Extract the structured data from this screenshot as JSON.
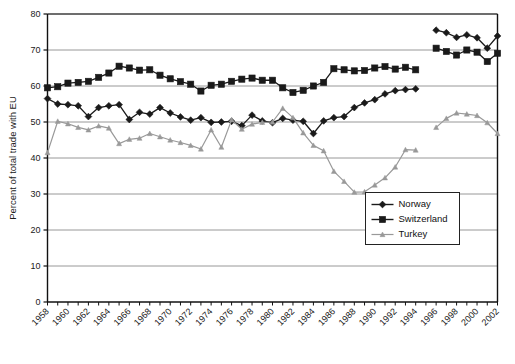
{
  "chart_data": {
    "type": "line",
    "title": "",
    "xlabel": "",
    "ylabel": "Percent of total trade with EU",
    "ylim": [
      0,
      80
    ],
    "ytick_values": [
      0,
      10,
      20,
      30,
      40,
      50,
      60,
      70,
      80
    ],
    "ytick_labels": [
      "0",
      "10",
      "20",
      "30",
      "40",
      "50",
      "60",
      "70",
      "80"
    ],
    "grid": true,
    "grid_axis": "y",
    "legend_position": "center-right",
    "xlim": [
      1958,
      2002
    ],
    "x": [
      1958,
      1959,
      1960,
      1961,
      1962,
      1963,
      1964,
      1965,
      1966,
      1967,
      1968,
      1969,
      1970,
      1971,
      1972,
      1973,
      1974,
      1975,
      1976,
      1977,
      1978,
      1979,
      1980,
      1981,
      1982,
      1983,
      1984,
      1985,
      1986,
      1987,
      1988,
      1989,
      1990,
      1991,
      1992,
      1993,
      1994,
      1995,
      1996,
      1997,
      1998,
      1999,
      2000,
      2001,
      2002
    ],
    "xtick_labels": [
      "1958",
      "1960",
      "1962",
      "1964",
      "1966",
      "1968",
      "1970",
      "1972",
      "1974",
      "1976",
      "1978",
      "1980",
      "1982",
      "1984",
      "1986",
      "1988",
      "1990",
      "1992",
      "1994",
      "1996",
      "1998",
      "2000",
      "2002"
    ],
    "xtick_values": [
      1958,
      1960,
      1962,
      1964,
      1966,
      1968,
      1970,
      1972,
      1974,
      1976,
      1978,
      1980,
      1982,
      1984,
      1986,
      1988,
      1990,
      1992,
      1994,
      1996,
      1998,
      2000,
      2002
    ],
    "series": [
      {
        "name": "Norway",
        "color": "#1a1a1a",
        "marker": "diamond",
        "values": [
          56.5,
          55.0,
          54.8,
          54.5,
          51.5,
          54.0,
          54.5,
          54.8,
          50.7,
          52.7,
          52.2,
          54.0,
          52.5,
          51.4,
          50.5,
          51.2,
          49.9,
          50.0,
          50.2,
          49.0,
          51.9,
          50.3,
          49.8,
          51.0,
          50.5,
          50.2,
          46.8,
          50.3,
          51.2,
          51.5,
          54.0,
          55.3,
          56.2,
          57.8,
          58.7,
          59.0,
          59.2,
          null,
          75.5,
          74.8,
          73.5,
          74.2,
          73.4,
          70.5,
          73.9
        ]
      },
      {
        "name": "Switzerland",
        "color": "#1a1a1a",
        "marker": "square",
        "values": [
          59.5,
          59.8,
          60.8,
          61.0,
          61.3,
          62.4,
          63.6,
          65.5,
          65.0,
          64.4,
          64.5,
          63.0,
          62.0,
          61.2,
          60.5,
          58.6,
          60.2,
          60.5,
          61.3,
          61.9,
          62.2,
          61.6,
          61.6,
          59.5,
          58.2,
          58.8,
          60.0,
          61.0,
          64.8,
          64.5,
          64.2,
          64.3,
          65.0,
          65.4,
          64.7,
          65.2,
          64.5,
          null,
          70.5,
          69.6,
          68.6,
          70.0,
          69.4,
          66.8,
          69.1
        ]
      },
      {
        "name": "Turkey",
        "color": "#999999",
        "marker": "triangle",
        "values": [
          41.5,
          50.2,
          49.5,
          48.5,
          47.8,
          48.9,
          48.3,
          44.0,
          45.2,
          45.5,
          46.8,
          45.9,
          45.0,
          44.3,
          43.5,
          42.5,
          47.8,
          43.0,
          50.6,
          48.0,
          49.4,
          49.9,
          50.0,
          53.8,
          51.2,
          47.0,
          43.5,
          42.0,
          36.3,
          33.5,
          30.5,
          30.6,
          32.5,
          34.5,
          37.5,
          42.3,
          42.2,
          null,
          48.5,
          51.0,
          52.5,
          52.2,
          51.8,
          49.8,
          46.8
        ]
      }
    ]
  },
  "legend": {
    "entries": [
      {
        "label": "Norway"
      },
      {
        "label": "Switzerland"
      },
      {
        "label": "Turkey"
      }
    ]
  }
}
